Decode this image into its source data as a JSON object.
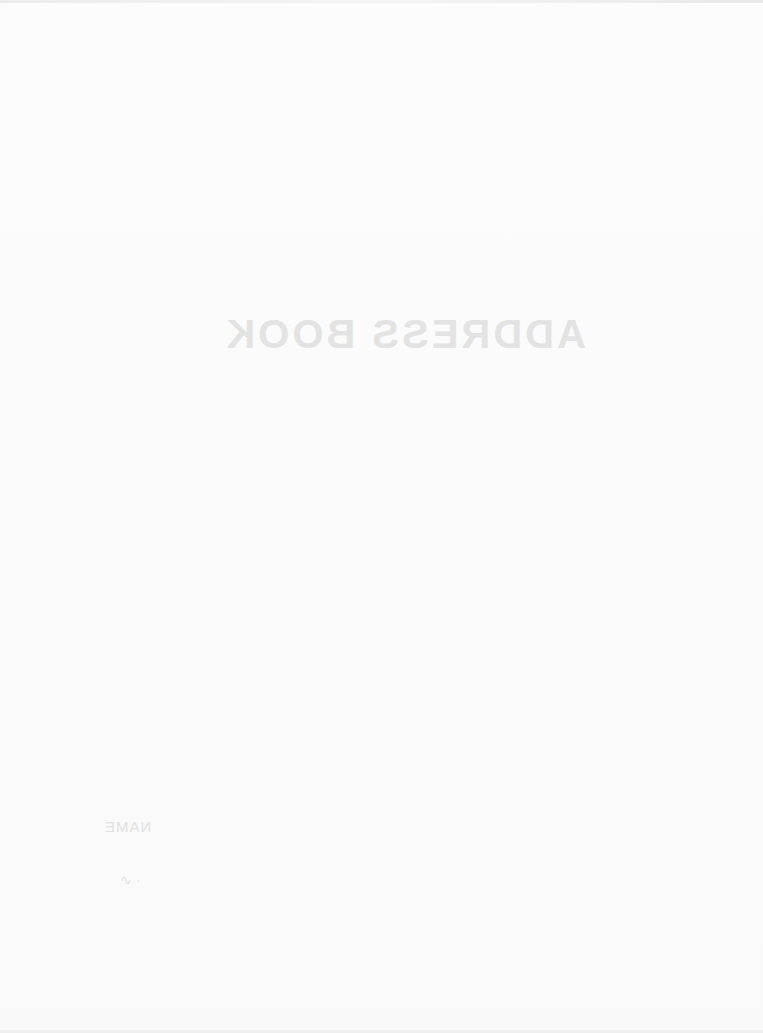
{
  "document": {
    "title": "ADDRESS BOOK",
    "title_rendering": "mirrored, faded",
    "footer_label": "NAME",
    "footer_mark": "∿ ·"
  },
  "colors": {
    "page": "#fbfbfb",
    "faded_text": "#e3e3e3"
  }
}
